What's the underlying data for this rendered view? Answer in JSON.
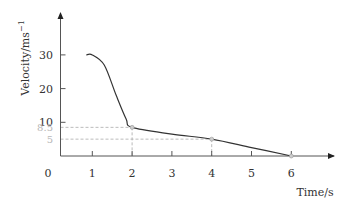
{
  "chart_data": {
    "type": "line",
    "title": "",
    "xlabel": "Time/s",
    "ylabel": "Velocity/ms",
    "ylabel_superscript": "−1",
    "origin_label": "0",
    "x_ticks": [
      1,
      2,
      3,
      4,
      5,
      6
    ],
    "y_ticks": [
      10,
      20,
      30
    ],
    "xlim": [
      0,
      7
    ],
    "ylim": [
      0,
      35
    ],
    "grid": false,
    "legend": null,
    "series": [
      {
        "name": "velocity",
        "x": [
          0.85,
          1.0,
          1.3,
          1.6,
          1.85,
          2.0,
          3.0,
          4.0,
          5.0,
          6.0
        ],
        "values": [
          30,
          30,
          27,
          18,
          11,
          8.5,
          6.5,
          5,
          2.5,
          0
        ]
      }
    ],
    "reference_points": [
      {
        "x": 2,
        "y": 8.5,
        "label": "8.5"
      },
      {
        "x": 4,
        "y": 5,
        "label": "5"
      },
      {
        "x": 6,
        "y": 0,
        "label": ""
      }
    ],
    "colors": {
      "curve": "#333333",
      "axis": "#555555",
      "reference": "#aaaaaa",
      "reference_label": "#b8b8b8"
    }
  }
}
